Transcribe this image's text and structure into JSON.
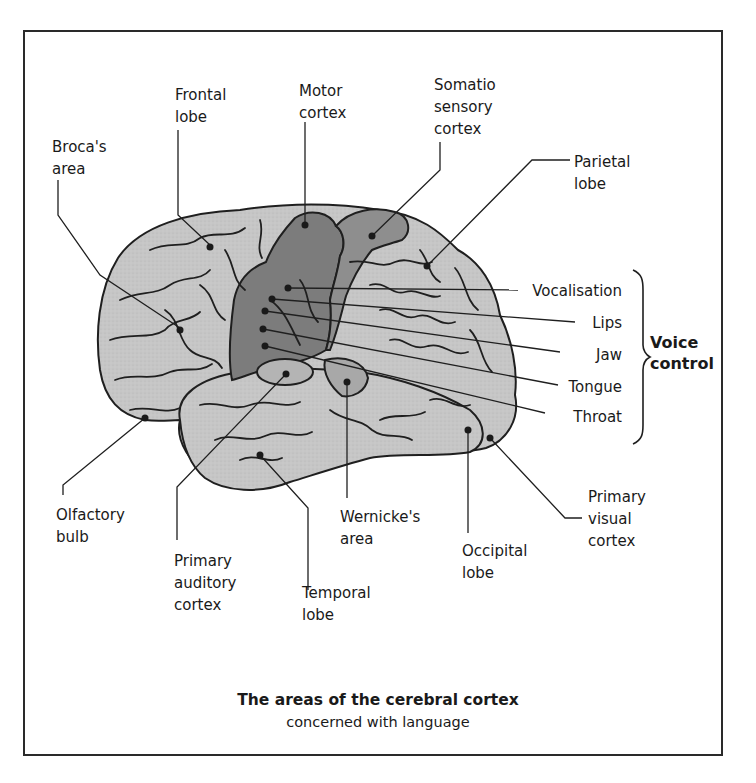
{
  "figure": {
    "title": "The areas of the cerebral cortex",
    "subtitle": "concerned with language"
  },
  "labels": {
    "brocas_area": "Broca's\narea",
    "frontal_lobe": "Frontal\nlobe",
    "motor_cortex": "Motor\ncortex",
    "somatosensory_cortex": "Somatio\nsensory\ncortex",
    "parietal_lobe": "Parietal\nlobe",
    "olfactory_bulb": "Olfactory\nbulb",
    "primary_auditory_cortex": "Primary\nauditory\ncortex",
    "temporal_lobe": "Temporal\nlobe",
    "wernickes_area": "Wernicke's\narea",
    "occipital_lobe": "Occipital\nlobe",
    "primary_visual_cortex": "Primary\nvisual\ncortex"
  },
  "voice_control": {
    "group_label": "Voice\ncontrol",
    "items": [
      "Vocalisation",
      "Lips",
      "Jaw",
      "Tongue",
      "Throat"
    ]
  },
  "colors": {
    "brain_fill": "#c4c4c4",
    "motor_fill": "#7c7c7c",
    "sensory_fill": "#8e8e8e",
    "highlight_fill": "#a8a8a8",
    "outline": "#1f1f1f",
    "frame": "#2a2a2a"
  }
}
